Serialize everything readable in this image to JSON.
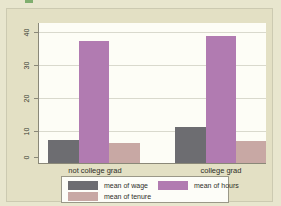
{
  "chart_data": {
    "type": "bar",
    "title": "",
    "subtitle": "",
    "xlabel": "",
    "ylabel": "",
    "categories": [
      "not college grad",
      "college grad"
    ],
    "series": [
      {
        "name": "mean of wage",
        "key": "wage",
        "color": "#6d6d71",
        "values": [
          7.0,
          10.9
        ]
      },
      {
        "name": "mean of hours",
        "key": "hours",
        "color": "#b17bb1",
        "values": [
          36.7,
          38.2
        ]
      },
      {
        "name": "mean of tenure",
        "key": "tenure",
        "color": "#c8a8a4",
        "values": [
          6.0,
          6.7
        ]
      }
    ],
    "ylim": [
      0,
      42
    ],
    "yticks": [
      0,
      10,
      20,
      30,
      40
    ],
    "ytick_labels": [
      "0",
      "10",
      "20",
      "30",
      "40"
    ],
    "grid": true,
    "grid_axis": "y",
    "legend_position": "bottom",
    "legend": [
      "mean of wage",
      "mean of hours",
      "mean of tenure"
    ],
    "bar_layout": "grouped"
  },
  "figure": {
    "background_color": "#e3e0c4",
    "plot_background_color": "#fdfdf6",
    "page_background_color": "#e8e6ce",
    "axis_color": "#8a8878",
    "grid_color": "#d9d9cd",
    "text_color": "#2e2e28",
    "corner_mark_color": "#7fae6e"
  }
}
